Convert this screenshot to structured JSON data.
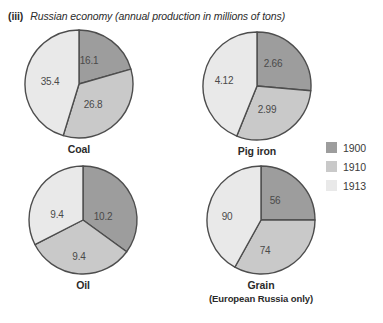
{
  "title": {
    "number": "(iii)",
    "text": "Russian economy (annual production in millions of tons)"
  },
  "colors": {
    "year_1900": "#9d9d9d",
    "year_1910": "#c9c9c9",
    "year_1913": "#e9e9e9",
    "slice_outline": "#4d4d4d",
    "text": "#3a3a3a"
  },
  "legend": {
    "position": "right",
    "items": [
      {
        "label": "1900",
        "color": "#9d9d9d"
      },
      {
        "label": "1910",
        "color": "#c9c9c9"
      },
      {
        "label": "1913",
        "color": "#e9e9e9"
      }
    ]
  },
  "chart_data": {
    "type": "pie",
    "title": "Russian economy (annual production in millions of tons)",
    "unit": "millions of tons",
    "series_names": [
      "1900",
      "1910",
      "1913"
    ],
    "charts": [
      {
        "name": "coal",
        "caption": "Coal",
        "caption_sub": "",
        "slices": [
          {
            "year": "1900",
            "value": "16.1",
            "color": "#9d9d9d",
            "angle": 74,
            "label_x": 66,
            "label_y": 32
          },
          {
            "year": "1910",
            "value": "26.8",
            "color": "#c9c9c9",
            "angle": 123,
            "label_x": 70,
            "label_y": 76
          },
          {
            "year": "1913",
            "value": "35.4",
            "color": "#e9e9e9",
            "angle": 163,
            "label_x": 27,
            "label_y": 53
          }
        ]
      },
      {
        "name": "pig-iron",
        "caption": "Pig iron",
        "caption_sub": "",
        "slices": [
          {
            "year": "1900",
            "value": "2.66",
            "color": "#9d9d9d",
            "angle": 95,
            "label_x": 72,
            "label_y": 33
          },
          {
            "year": "1910",
            "value": "2.99",
            "color": "#c9c9c9",
            "angle": 107,
            "label_x": 66,
            "label_y": 79
          },
          {
            "year": "1913",
            "value": "4.12",
            "color": "#e9e9e9",
            "angle": 158,
            "label_x": 23,
            "label_y": 50
          }
        ]
      },
      {
        "name": "oil",
        "caption": "Oil",
        "caption_sub": "",
        "slices": [
          {
            "year": "1900",
            "value": "10.2",
            "color": "#9d9d9d",
            "angle": 126,
            "label_x": 76,
            "label_y": 52
          },
          {
            "year": "1910",
            "value": "9.4",
            "color": "#c9c9c9",
            "angle": 117,
            "label_x": 52,
            "label_y": 92
          },
          {
            "year": "1913",
            "value": "9.4",
            "color": "#e9e9e9",
            "angle": 117,
            "label_x": 30,
            "label_y": 50
          }
        ]
      },
      {
        "name": "grain",
        "caption": "Grain",
        "caption_sub": "(European Russia only)",
        "slices": [
          {
            "year": "1900",
            "value": "56",
            "color": "#9d9d9d",
            "angle": 90,
            "label_x": 70,
            "label_y": 36
          },
          {
            "year": "1910",
            "value": "74",
            "color": "#c9c9c9",
            "angle": 119,
            "label_x": 60,
            "label_y": 86
          },
          {
            "year": "1913",
            "value": "90",
            "color": "#e9e9e9",
            "angle": 151,
            "label_x": 22,
            "label_y": 52
          }
        ]
      }
    ]
  }
}
